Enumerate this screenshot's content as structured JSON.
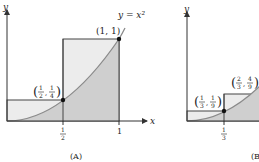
{
  "panels": [
    {
      "id": "A",
      "caption": "(A)",
      "x_axis_label": "x",
      "y_axis_label": "y",
      "curve_label": "y = x²",
      "x_ticks": [
        {
          "value": "1/2",
          "num": "1",
          "den": "2"
        },
        {
          "value": "1",
          "text": "1"
        }
      ],
      "points": [
        {
          "label": "(1/2, 1/4)",
          "x_num": "1",
          "x_den": "2",
          "y_num": "1",
          "y_den": "4"
        },
        {
          "label": "(1, 1)",
          "text": "(1, 1)"
        }
      ]
    },
    {
      "id": "B",
      "caption": "(B",
      "y_axis_label": "y",
      "x_ticks": [
        {
          "value": "1/3",
          "num": "1",
          "den": "3"
        }
      ],
      "points": [
        {
          "label": "(1/3, 1/9)",
          "x_num": "1",
          "x_den": "3",
          "y_num": "1",
          "y_den": "9"
        },
        {
          "label": "(2/3, 4/9)",
          "x_num": "2",
          "x_den": "3",
          "y_num": "4",
          "y_den": "9"
        }
      ]
    }
  ],
  "colors": {
    "rect_fill": "#ececec",
    "under_curve_fill": "#cfcfcf",
    "curve": "#8a8a8a",
    "axis": "#333333"
  }
}
